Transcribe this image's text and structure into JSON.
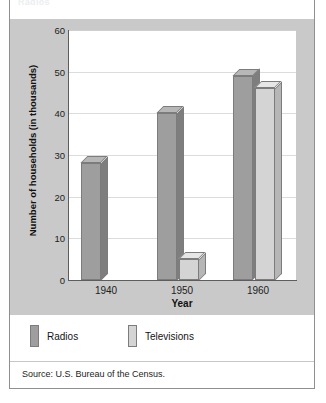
{
  "figure": {
    "title_cutoff": "Radios",
    "source": "Source: U.S. Bureau of the Census."
  },
  "colors": {
    "radios_face": "#9e9e9e",
    "radios_top": "#b7b7b7",
    "radios_side": "#7e7e7e",
    "televisions_face": "#d4d4d4",
    "televisions_top": "#e6e6e6",
    "televisions_side": "#b6b6b6",
    "panel_bg": "#c9c9c9",
    "plot_bg": "#ffffff",
    "grid": "#dcdcdc",
    "axis": "#5d5d5d",
    "text": "#1d1d1d"
  },
  "legend": {
    "position": "below-plot",
    "entries": [
      {
        "label": "Radios",
        "color": "#9e9e9e"
      },
      {
        "label": "Televisions",
        "color": "#d4d4d4"
      }
    ]
  },
  "chart_data": {
    "type": "bar",
    "title": "",
    "xlabel": "Year",
    "ylabel": "Number of households (in thousands)",
    "categories": [
      "1940",
      "1950",
      "1960"
    ],
    "series": [
      {
        "name": "Radios",
        "values": [
          28,
          40,
          49
        ]
      },
      {
        "name": "Televisions",
        "values": [
          0,
          5,
          46
        ]
      }
    ],
    "ylim": [
      0,
      60
    ],
    "yticks": [
      0,
      10,
      20,
      30,
      40,
      50,
      60
    ],
    "ytick_labels": [
      "0",
      "10",
      "20",
      "30",
      "40",
      "50",
      "60"
    ],
    "grid": true,
    "grid_axis": "y",
    "legend_entries": [
      "Radios",
      "Televisions"
    ],
    "style": "3d-columns",
    "source": "Source: U.S. Bureau of the Census."
  }
}
